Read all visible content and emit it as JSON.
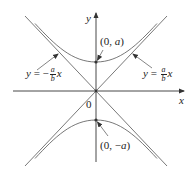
{
  "figure": {
    "type": "hyperbola-with-asymptotes",
    "equation_form": "y^2/a^2 - x^2/b^2 = 1",
    "axes": {
      "x_label": "x",
      "y_label": "y",
      "origin_label": "0"
    },
    "vertices": [
      {
        "label": "(0, a)",
        "prefix": "(0, ",
        "var": "a",
        "suffix": ")"
      },
      {
        "label": "(0, −a)",
        "prefix": "(0, −",
        "var": "a",
        "suffix": ")"
      }
    ],
    "asymptotes": [
      {
        "label": "y = −(a/b)x",
        "lhs": "y",
        "eq": " = −",
        "num": "a",
        "den": "b",
        "var": "x"
      },
      {
        "label": "y = (a/b)x",
        "lhs": "y",
        "eq": " = ",
        "num": "a",
        "den": "b",
        "var": "x"
      }
    ],
    "colors": {
      "curve": "#555555",
      "axis": "#333333",
      "text": "#222222",
      "background": "#ffffff"
    }
  }
}
